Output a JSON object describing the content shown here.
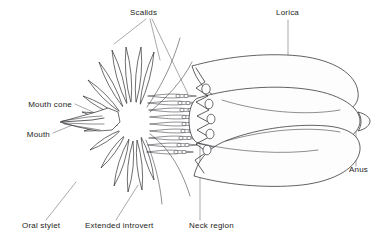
{
  "figure": {
    "background_color": "#ffffff",
    "ink_color": "#1a1a1a",
    "leader_color": "#6e6e76",
    "width": 385,
    "height": 243
  },
  "labels": [
    {
      "id": "scalids",
      "text": "Scalids",
      "x": 130,
      "y": 15,
      "anchor": "start",
      "leaders": [
        "M 146 19 L 114 44",
        "M 150 19 L 160 60",
        "M 152 19 L 188 94"
      ]
    },
    {
      "id": "lorica",
      "text": "Lorica",
      "x": 276,
      "y": 15,
      "anchor": "start",
      "leaders": [
        "M 288 20 L 288 78"
      ]
    },
    {
      "id": "mouth-cone",
      "text": "Mouth cone",
      "x": 72,
      "y": 107,
      "anchor": "end",
      "leaders": [
        "M 75 104 L 95 113"
      ]
    },
    {
      "id": "mouth",
      "text": "Mouth",
      "x": 50,
      "y": 137,
      "anchor": "end",
      "leaders": [
        "M 53 133 L 80 122"
      ]
    },
    {
      "id": "anus",
      "text": "Anus",
      "x": 349,
      "y": 172,
      "anchor": "start",
      "leaders": [
        "M 356 166 L 356 126"
      ]
    },
    {
      "id": "oral-stylet",
      "text": "Oral stylet",
      "x": 22,
      "y": 228,
      "anchor": "start",
      "leaders": [
        "M 46 220 L 76 182"
      ]
    },
    {
      "id": "extended-introvert",
      "text": "Extended introvert",
      "x": 85,
      "y": 228,
      "anchor": "start",
      "leaders": [
        "M 116 220 L 138 185"
      ]
    },
    {
      "id": "neck-region",
      "text": "Neck  region",
      "x": 189,
      "y": 228,
      "anchor": "start",
      "leaders": [
        "M 200 220 L 200 143"
      ]
    }
  ],
  "anatomy": {
    "mouth_cone": {
      "name": "mouth-cone",
      "outline": "M 60 122 L 96 112 L 108 108 L 118 112 L 120 122 L 112 130 L 98 131 L 78 127 Z",
      "mouth_slit": "M 62 122 L 92 120 L 104 118"
    },
    "oral_stylets": [
      "M 62 121 L 88 117 L 102 116",
      "M 63 123 L 90 124 L 104 124",
      "M 64 124 L 88 128 L 100 130"
    ],
    "introvert_rosette_center": {
      "cx": 133,
      "cy": 121,
      "rx": 16,
      "ry": 19
    },
    "radiating_scalids": [
      {
        "tipx": 112,
        "tipy": 50,
        "basex": 127,
        "basey": 104,
        "w": 5.4
      },
      {
        "tipx": 126,
        "tipy": 47,
        "basex": 131,
        "basey": 103,
        "w": 5.2
      },
      {
        "tipx": 141,
        "tipy": 47,
        "basex": 136,
        "basey": 103,
        "w": 5.2
      },
      {
        "tipx": 154,
        "tipy": 52,
        "basex": 140,
        "basey": 105,
        "w": 4.8
      },
      {
        "tipx": 99,
        "tipy": 62,
        "basex": 123,
        "basey": 107,
        "w": 4.6
      },
      {
        "tipx": 88,
        "tipy": 80,
        "basex": 120,
        "basey": 112,
        "w": 4.2
      },
      {
        "tipx": 83,
        "tipy": 96,
        "basex": 118,
        "basey": 116,
        "w": 4.0
      },
      {
        "tipx": 82,
        "tipy": 112,
        "basex": 117,
        "basey": 120,
        "w": 3.8
      },
      {
        "tipx": 84,
        "tipy": 131,
        "basex": 118,
        "basey": 125,
        "w": 3.8
      },
      {
        "tipx": 90,
        "tipy": 150,
        "basex": 121,
        "basey": 130,
        "w": 4.0
      },
      {
        "tipx": 101,
        "tipy": 168,
        "basex": 125,
        "basey": 135,
        "w": 4.4
      },
      {
        "tipx": 114,
        "tipy": 186,
        "basex": 129,
        "basey": 139,
        "w": 5.0
      },
      {
        "tipx": 128,
        "tipy": 192,
        "basex": 133,
        "basey": 141,
        "w": 5.2
      },
      {
        "tipx": 142,
        "tipy": 190,
        "basex": 137,
        "basey": 140,
        "w": 5.0
      },
      {
        "tipx": 154,
        "tipy": 180,
        "basex": 141,
        "basey": 137,
        "w": 4.6
      }
    ],
    "long_sweeping_scalids": [
      "M 147 107 C 160 88 172 66 180 38",
      "M 150 112 C 166 98 182 82 192 62",
      "M 150 134 C 166 146 180 164 190 196",
      "M 146 140 C 154 160 160 182 162 204"
    ],
    "introvert_rows": [
      {
        "y": 96,
        "x1": 148,
        "x2": 196,
        "pores": [
          178,
          186
        ]
      },
      {
        "y": 103,
        "x1": 148,
        "x2": 199,
        "pores": [
          180,
          188
        ]
      },
      {
        "y": 110,
        "x1": 149,
        "x2": 201,
        "pores": [
          182,
          190
        ]
      },
      {
        "y": 117,
        "x1": 150,
        "x2": 203,
        "pores": [
          184,
          192
        ]
      },
      {
        "y": 124,
        "x1": 150,
        "x2": 203,
        "pores": [
          184,
          192
        ]
      },
      {
        "y": 131,
        "x1": 150,
        "x2": 202,
        "pores": [
          183,
          191
        ]
      },
      {
        "y": 138,
        "x1": 149,
        "x2": 200,
        "pores": [
          181,
          189
        ]
      },
      {
        "y": 145,
        "x1": 148,
        "x2": 197,
        "pores": [
          179,
          187
        ]
      },
      {
        "y": 152,
        "x1": 147,
        "x2": 193,
        "pores": [
          176,
          184
        ]
      }
    ],
    "neck_zigzag": "M 196 68 L 205 82 L 196 88 L 208 96 L 196 102 L 209 110 L 197 116 L 210 123 L 197 130 L 209 137 L 196 144 L 207 152 L 195 160 L 204 173",
    "neck_spines": [
      {
        "cx": 206,
        "cy": 89,
        "rx": 4.2,
        "ry": 5.0
      },
      {
        "cx": 209,
        "cy": 104,
        "rx": 4.0,
        "ry": 4.8
      },
      {
        "cx": 211,
        "cy": 119,
        "rx": 4.0,
        "ry": 4.8
      },
      {
        "cx": 210,
        "cy": 134,
        "rx": 4.0,
        "ry": 4.8
      },
      {
        "cx": 207,
        "cy": 150,
        "rx": 4.0,
        "ry": 4.8
      }
    ],
    "lorica_plates": [
      {
        "name": "dorsal-plate",
        "d": "M 192 66 C 220 58 262 52 300 56 C 334 60 356 74 358 92 C 360 106 348 114 326 116 C 292 119 250 112 222 100 C 206 93 196 80 192 66 Z"
      },
      {
        "name": "mid-plate",
        "d": "M 198 98 C 230 88 276 84 312 90 C 342 95 360 108 360 121 C 360 134 342 146 312 151 C 276 157 230 153 198 143 C 186 139 186 102 198 98 Z"
      },
      {
        "name": "ventral-plate",
        "d": "M 194 176 C 222 184 264 189 302 185 C 336 181 358 167 360 150 C 361 136 349 128 327 126 C 293 123 251 130 223 142 C 207 149 197 162 194 176 Z"
      }
    ],
    "lorica_seams": [
      "M 222 100 C 260 112 306 116 340 110",
      "M 226 141 C 264 130 308 126 340 132",
      "M 198 143 C 236 152 284 155 318 150"
    ],
    "anus_papilla": "M 358 112 C 366 114 370 118 370 121 C 370 125 366 129 358 131 C 362 126 362 117 358 112 Z"
  }
}
